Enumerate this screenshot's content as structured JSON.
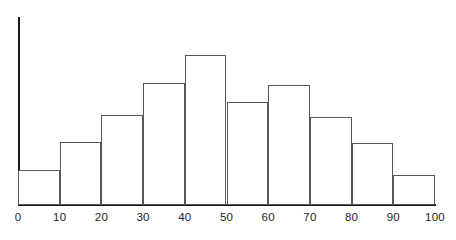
{
  "chart_data": {
    "type": "bar",
    "chart_subtype": "histogram",
    "title": "",
    "subtitle": "",
    "xlabel": "",
    "ylabel": "",
    "grid": false,
    "legend": null,
    "legend_position": "none",
    "bin_width": 10,
    "bin_edges": [
      0,
      10,
      20,
      30,
      40,
      50,
      60,
      70,
      80,
      90,
      100
    ],
    "categories": [
      "0-10",
      "10-20",
      "20-30",
      "30-40",
      "40-50",
      "50-60",
      "60-70",
      "70-80",
      "80-90",
      "90-100"
    ],
    "values": [
      7,
      12.5,
      18,
      24.5,
      30,
      20.5,
      24,
      17.5,
      12.5,
      6
    ],
    "bar_pixel_heights": [
      35,
      63,
      90,
      122,
      150,
      103,
      120,
      88,
      62,
      30
    ],
    "xlim": [
      0,
      100
    ],
    "ylim": [
      0,
      38
    ],
    "x_tick_labels": [
      "0",
      "10",
      "20",
      "30",
      "40",
      "50",
      "60",
      "70",
      "80",
      "90",
      "100"
    ],
    "x_tick_values": [
      0,
      10,
      20,
      30,
      40,
      50,
      60,
      70,
      80,
      90,
      100
    ],
    "y_tick_labels": [],
    "y_tick_values": [],
    "colors": {
      "bar_fill": "#ffffff",
      "bar_stroke": "#575757",
      "axis": "#181818",
      "text": "#1d1d1d",
      "background": "#ffffff"
    }
  }
}
